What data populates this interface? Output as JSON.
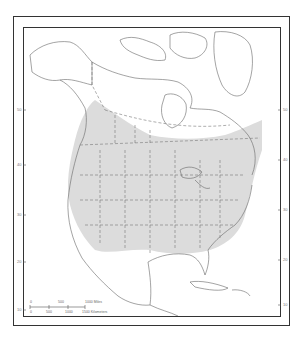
{
  "map": {
    "region": "North America",
    "shading_color": "#d9d9d9",
    "line_color": "#555555",
    "latitude_labels_left": [
      "50",
      "40",
      "30",
      "20",
      "10"
    ],
    "latitude_labels_right": [
      "50",
      "40",
      "30",
      "20",
      "10"
    ],
    "scale_bar": {
      "miles_labels": [
        "0",
        "500",
        "1000 Miles"
      ],
      "km_labels": [
        "0",
        "500",
        "1000",
        "1500 Kilometers"
      ]
    }
  }
}
